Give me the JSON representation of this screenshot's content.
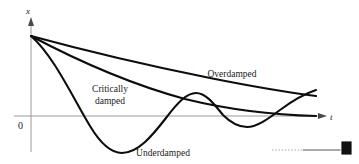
{
  "figure": {
    "axes": {
      "y_label": "x",
      "x_label": "t",
      "origin_label": "0"
    },
    "labels": {
      "overdamped": "Overdamped",
      "critically_line1": "Critically",
      "critically_line2": "damped",
      "underdamped": "Underdamped"
    },
    "handle": {
      "name": "drag-handle"
    },
    "colors": {
      "curve": "#0d0d0d",
      "axis": "#9a9a9a",
      "text": "#1a1a1a",
      "handle_square": "#111111",
      "handle_line": "#8c8c8c",
      "handle_dotted": "#c9c9c9",
      "background": "#ffffff"
    }
  },
  "chart_data": {
    "type": "line",
    "xlabel": "t",
    "ylabel": "x",
    "grid": false,
    "legend": "inline-annotations",
    "xlim": [
      0,
      300
    ],
    "ylim": [
      -60,
      90
    ],
    "origin_px": {
      "x": 31,
      "y": 116
    },
    "series": [
      {
        "name": "Overdamped",
        "label": "Overdamped",
        "path": "M 31 36 C 90 52, 150 66, 210 78 C 250 86, 285 92, 316 96",
        "points_px": [
          [
            31,
            36
          ],
          [
            60,
            44
          ],
          [
            90,
            52
          ],
          [
            120,
            59
          ],
          [
            150,
            66
          ],
          [
            180,
            72
          ],
          [
            210,
            78
          ],
          [
            240,
            84
          ],
          [
            270,
            90
          ],
          [
            300,
            94
          ],
          [
            316,
            96
          ]
        ]
      },
      {
        "name": "Critically damped",
        "label": "Critically damped",
        "path": "M 31 36 C 80 62, 130 84, 185 99 C 230 110, 275 115, 316 116",
        "points_px": [
          [
            31,
            36
          ],
          [
            60,
            53
          ],
          [
            90,
            68
          ],
          [
            120,
            80
          ],
          [
            150,
            90
          ],
          [
            180,
            98
          ],
          [
            210,
            105
          ],
          [
            240,
            110
          ],
          [
            270,
            113
          ],
          [
            300,
            115
          ],
          [
            316,
            116
          ]
        ]
      },
      {
        "name": "Underdamped",
        "label": "Underdamped",
        "path": "M 31 36 C 54 56, 74 100, 90 126 C 102 146, 112 153, 122 153 C 138 153, 152 136, 166 118 C 178 102, 187 93, 196 93 C 206 93, 214 104, 223 115 C 232 124, 240 127, 247 127 C 257 127, 268 119, 280 110 C 292 101, 304 94, 316 90",
        "key_points_px": [
          {
            "role": "start",
            "x": 31,
            "y": 36
          },
          {
            "role": "trough-1",
            "x": 122,
            "y": 153
          },
          {
            "role": "peak-1",
            "x": 196,
            "y": 93
          },
          {
            "role": "trough-2",
            "x": 247,
            "y": 127
          },
          {
            "role": "end",
            "x": 316,
            "y": 90
          }
        ]
      }
    ],
    "annotations": [
      {
        "text": "Overdamped",
        "x_px": 232,
        "y_px": 76
      },
      {
        "text": "Critically",
        "x_px": 107,
        "y_px": 91
      },
      {
        "text": "damped",
        "x_px": 110,
        "y_px": 103
      },
      {
        "text": "Underdamped",
        "x_px": 160,
        "y_px": 153
      },
      {
        "text": "x",
        "x_px": 28,
        "y_px": 13
      },
      {
        "text": "t",
        "x_px": 331,
        "y_px": 120
      },
      {
        "text": "0",
        "x_px": 21,
        "y_px": 128
      }
    ]
  }
}
